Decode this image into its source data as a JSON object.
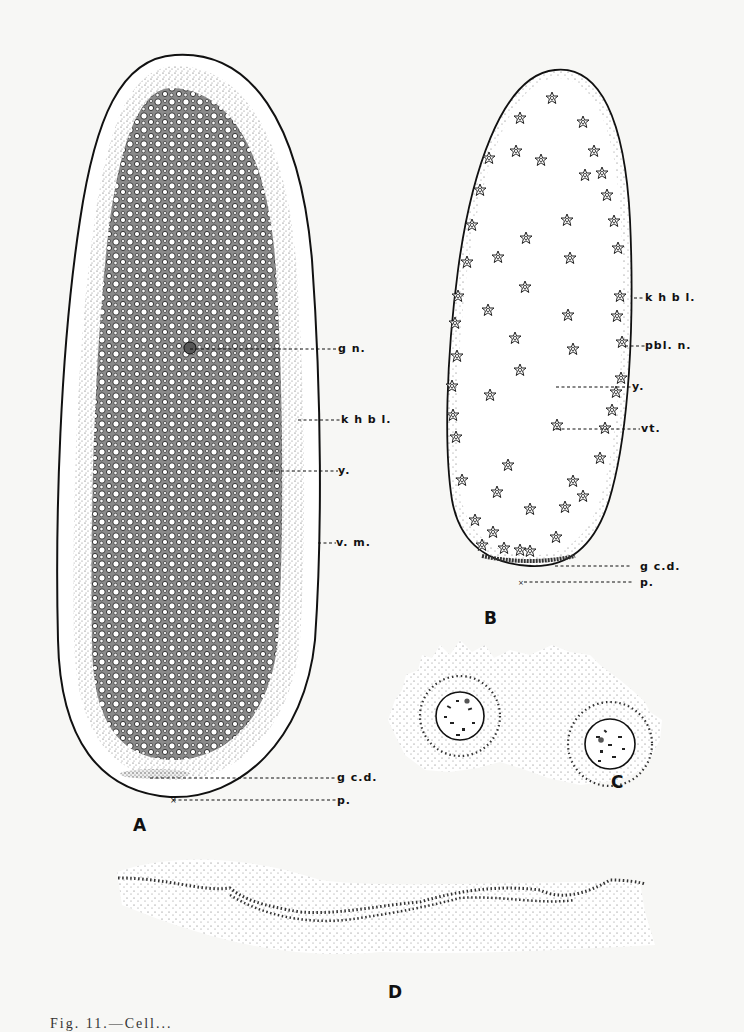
{
  "figure": {
    "panels": {
      "A": {
        "letter": "A",
        "labels": {
          "gn": "g n.",
          "khbl": "k h b l.",
          "y": "y.",
          "vm": "v. m.",
          "gcd": "g c.d.",
          "p": "p."
        }
      },
      "B": {
        "letter": "B",
        "labels": {
          "khbl": "k h b l.",
          "pbln": "pbl. n.",
          "y": "y.",
          "vt": "vt.",
          "gcd": "g c.d.",
          "p": "p."
        }
      },
      "C": {
        "letter": "C"
      },
      "D": {
        "letter": "D"
      }
    },
    "caption": "Fig. 11.—Cell..."
  },
  "colors": {
    "ink": "#111111",
    "paper": "#f7f7f5",
    "stipple": "#555555"
  }
}
